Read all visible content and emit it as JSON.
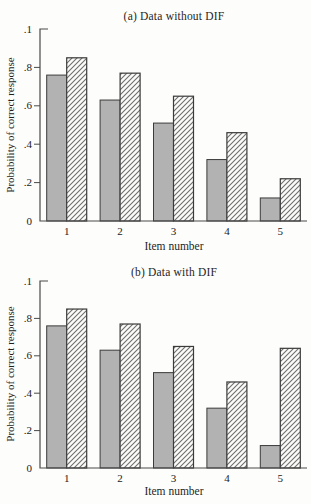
{
  "page": {
    "background": "#fdfdfb"
  },
  "colors": {
    "bar_fill_gray": "#b2b2b2",
    "bar_edge": "#3b3b3b",
    "hatch_fill": "#fbfbf9",
    "hatch_line": "#6e6e6e",
    "axis": "#4a4a4a",
    "text": "#222222"
  },
  "chart_data": [
    {
      "type": "bar",
      "title": "(a) Data without DIF",
      "xlabel": "Item number",
      "ylabel": "Probability of correct response",
      "categories": [
        "1",
        "2",
        "3",
        "4",
        "5"
      ],
      "series": [
        {
          "name": "solid-gray-bars",
          "values": [
            0.76,
            0.63,
            0.51,
            0.32,
            0.12
          ]
        },
        {
          "name": "hatched-bars",
          "values": [
            0.85,
            0.77,
            0.65,
            0.46,
            0.22
          ]
        }
      ],
      "ylim": [
        0,
        1
      ],
      "yticks": [
        {
          "value": 1.0,
          "label": ".1"
        },
        {
          "value": 0.8,
          "label": ".8"
        },
        {
          "value": 0.6,
          "label": ".6"
        },
        {
          "value": 0.4,
          "label": ".4"
        },
        {
          "value": 0.2,
          "label": ".2"
        },
        {
          "value": 0.0,
          "label": "0"
        }
      ],
      "grid": false,
      "legend": "none"
    },
    {
      "type": "bar",
      "title": "(b) Data with DIF",
      "xlabel": "Item number",
      "ylabel": "Probability of correct response",
      "categories": [
        "1",
        "2",
        "3",
        "4",
        "5"
      ],
      "series": [
        {
          "name": "solid-gray-bars",
          "values": [
            0.76,
            0.63,
            0.51,
            0.32,
            0.12
          ]
        },
        {
          "name": "hatched-bars",
          "values": [
            0.85,
            0.77,
            0.65,
            0.46,
            0.64
          ]
        }
      ],
      "ylim": [
        0,
        1
      ],
      "yticks": [
        {
          "value": 1.0,
          "label": ".1"
        },
        {
          "value": 0.8,
          "label": ".8"
        },
        {
          "value": 0.6,
          "label": ".6"
        },
        {
          "value": 0.4,
          "label": ".4"
        },
        {
          "value": 0.2,
          "label": ".2"
        },
        {
          "value": 0.0,
          "label": "0"
        }
      ],
      "grid": false,
      "legend": "none"
    }
  ]
}
